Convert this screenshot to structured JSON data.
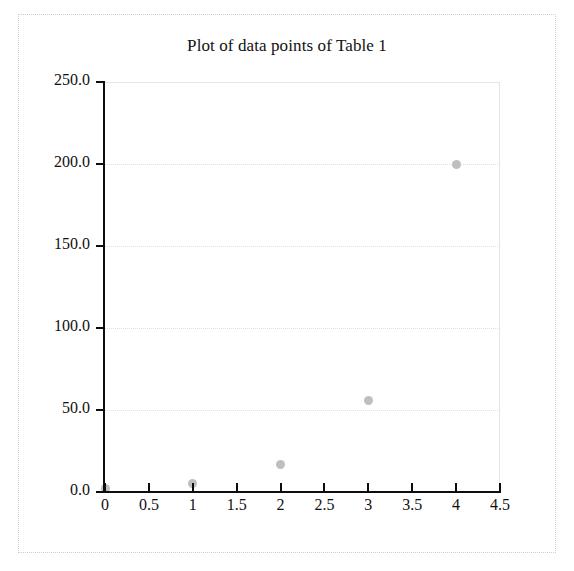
{
  "figure": {
    "title": "Plot of data points of Table 1",
    "marker_color": "#b4b4b4",
    "axis_color": "#0d0d0d",
    "grid_color": "#e0e0e0",
    "frame_color": "#cfcfcf"
  },
  "chart_data": {
    "type": "scatter",
    "title": "Plot of data points of Table 1",
    "xlabel": "",
    "ylabel": "",
    "xlim": [
      0,
      4.5
    ],
    "ylim": [
      0,
      250
    ],
    "grid": true,
    "legend": "none",
    "x": [
      0,
      1,
      2,
      3,
      4
    ],
    "y": [
      2,
      5,
      17,
      56,
      200
    ],
    "points": [
      {
        "x": 0,
        "y": 2
      },
      {
        "x": 1,
        "y": 5
      },
      {
        "x": 2,
        "y": 17
      },
      {
        "x": 3,
        "y": 56
      },
      {
        "x": 4,
        "y": 200
      }
    ],
    "xticks": [
      0,
      0.5,
      1,
      1.5,
      2,
      2.5,
      3,
      3.5,
      4,
      4.5
    ],
    "xticklabels": [
      "0",
      "0.5",
      "1",
      "1.5",
      "2",
      "2.5",
      "3",
      "3.5",
      "4",
      "4.5"
    ],
    "yticks": [
      0,
      50,
      100,
      150,
      200,
      250
    ],
    "yticklabels": [
      "0.0",
      "50.0",
      "100.0",
      "150.0",
      "200.0",
      "250.0"
    ]
  }
}
